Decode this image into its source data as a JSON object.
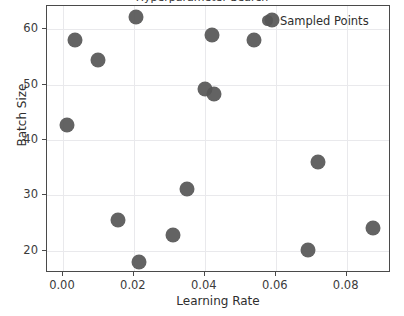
{
  "chart_data": {
    "type": "scatter",
    "title": "Hyperparameter Search",
    "xlabel": "Learning Rate",
    "ylabel": "Batch Size",
    "xlim": [
      -0.0045,
      0.0925
    ],
    "ylim": [
      16.0,
      64.2
    ],
    "grid": true,
    "legend_position": "upper right",
    "marker_color": "#565656",
    "grid_color": "#e9e9ec",
    "axes_color": "#4a4a4a",
    "background_color": "#ffffff",
    "xticks": [
      0.0,
      0.02,
      0.04,
      0.06,
      0.08
    ],
    "xticklabels": [
      "0.00",
      "0.02",
      "0.04",
      "0.06",
      "0.08"
    ],
    "yticks": [
      20,
      30,
      40,
      50,
      60
    ],
    "yticklabels": [
      "20",
      "30",
      "40",
      "50",
      "60"
    ],
    "series": [
      {
        "name": "Sampled Points",
        "x": [
          0.0205,
          0.0035,
          0.01,
          0.001,
          0.0155,
          0.0215,
          0.031,
          0.035,
          0.04,
          0.0425,
          0.042,
          0.054,
          0.059,
          0.069,
          0.072,
          0.0875
        ],
        "y": [
          62.2,
          58.1,
          54.4,
          42.7,
          25.5,
          18.0,
          22.8,
          31.1,
          49.3,
          48.3,
          59.0,
          58.0,
          61.6,
          20.2,
          36.0,
          24.2
        ]
      }
    ]
  }
}
